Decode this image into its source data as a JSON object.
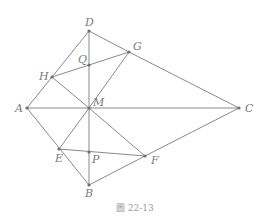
{
  "figure": {
    "caption": "圖 22-13",
    "points": {
      "A": {
        "label": "A",
        "x": 27,
        "y": 108
      },
      "B": {
        "label": "B",
        "x": 89,
        "y": 185
      },
      "C": {
        "label": "C",
        "x": 239,
        "y": 108
      },
      "D": {
        "label": "D",
        "x": 89,
        "y": 31
      },
      "E": {
        "label": "E",
        "x": 59,
        "y": 149
      },
      "F": {
        "label": "F",
        "x": 145,
        "y": 156
      },
      "G": {
        "label": "G",
        "x": 129,
        "y": 52
      },
      "H": {
        "label": "H",
        "x": 52,
        "y": 77
      },
      "M": {
        "label": "M",
        "x": 89,
        "y": 108
      },
      "P": {
        "label": "P",
        "x": 89,
        "y": 152
      },
      "Q": {
        "label": "Q",
        "x": 89,
        "y": 65
      }
    },
    "segments": [
      [
        "A",
        "D"
      ],
      [
        "D",
        "G"
      ],
      [
        "G",
        "C"
      ],
      [
        "A",
        "C"
      ],
      [
        "D",
        "B"
      ],
      [
        "A",
        "B"
      ],
      [
        "H",
        "G"
      ],
      [
        "H",
        "M"
      ],
      [
        "M",
        "G"
      ],
      [
        "E",
        "M"
      ],
      [
        "E",
        "F"
      ],
      [
        "M",
        "F"
      ],
      [
        "B",
        "F"
      ],
      [
        "F",
        "C"
      ]
    ],
    "colors": {
      "line": "#8a8a8a",
      "point": "#6e6e6e",
      "label": "#7a7a7a"
    }
  }
}
